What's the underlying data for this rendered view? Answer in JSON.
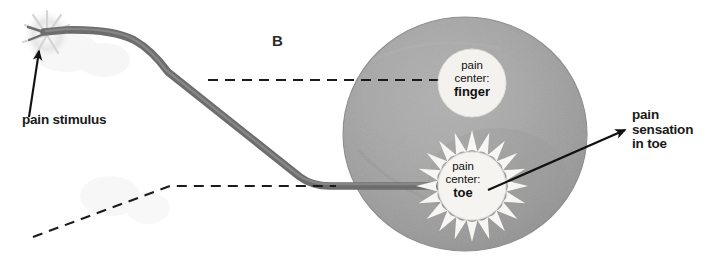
{
  "figure": {
    "panel_letter": "B",
    "caption_labels": {
      "stimulus": "pain stimulus",
      "sensation_line1": "pain",
      "sensation_line2": "sensation",
      "sensation_line3": "in toe"
    },
    "brain": {
      "name": "brain-disc",
      "fill_color": "#a2a2a2",
      "edge_color": "#8d8d8d"
    },
    "pain_centers": [
      {
        "id": "finger",
        "line1": "pain",
        "line2": "center:",
        "line3": "finger",
        "activated": false,
        "fill_color": "#f3f2ee"
      },
      {
        "id": "toe",
        "line1": "pain",
        "line2": "center:",
        "line3": "toe",
        "activated": true,
        "fill_color": "#f5f4f0",
        "burst_color": "#f7f6f2",
        "burst_rays": 20
      }
    ],
    "nerve": {
      "name": "nerve-pathway",
      "color": "#6d6d6d",
      "highlight_color": "#8a8a8a"
    },
    "dashed_lines": {
      "color": "#1b1b1b",
      "upper_label": "finger pathway (inactive)",
      "lower_label": "toe pathway (inactive)"
    },
    "arrows": {
      "stimulus_arrow": "arrow pointing to nerve ending",
      "sensation_arrow": "arrow from toe center to label",
      "color": "#111111"
    },
    "starburst_stimulus": {
      "name": "stimulus-flash",
      "color": "#d8d8d8"
    }
  }
}
